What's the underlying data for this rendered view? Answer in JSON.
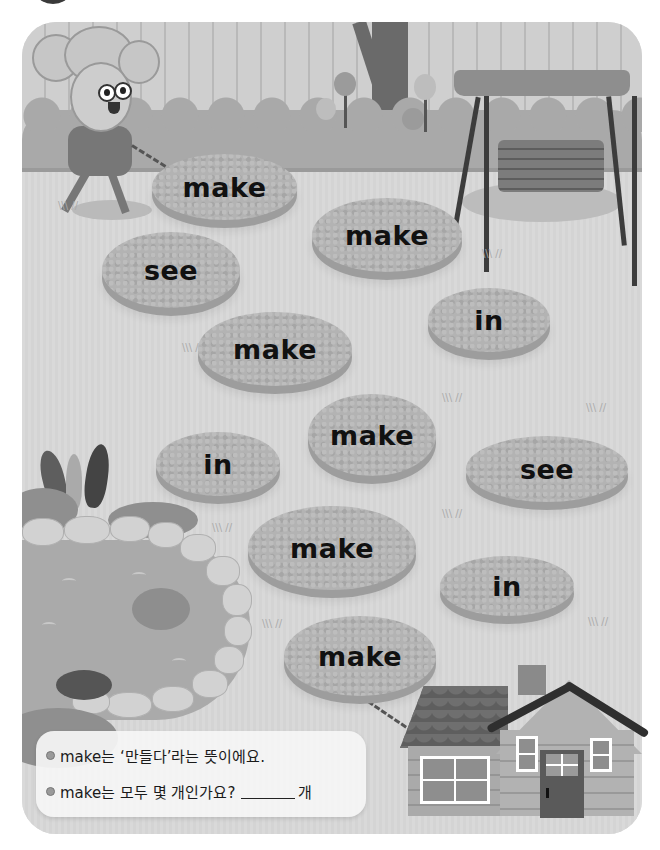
{
  "colors": {
    "stone": "#b3b3b3",
    "lawn": "#d8d8d8",
    "text": "#111111",
    "info_box_bg": "#f5f5f5"
  },
  "stones": [
    {
      "word": "make",
      "x": 152,
      "y": 154,
      "w": 145,
      "h": 66
    },
    {
      "word": "make",
      "x": 312,
      "y": 198,
      "w": 150,
      "h": 74
    },
    {
      "word": "see",
      "x": 102,
      "y": 232,
      "w": 138,
      "h": 76
    },
    {
      "word": "in",
      "x": 428,
      "y": 288,
      "w": 122,
      "h": 64
    },
    {
      "word": "make",
      "x": 198,
      "y": 312,
      "w": 154,
      "h": 74
    },
    {
      "word": "make",
      "x": 308,
      "y": 394,
      "w": 128,
      "h": 82
    },
    {
      "word": "in",
      "x": 156,
      "y": 432,
      "w": 124,
      "h": 64
    },
    {
      "word": "see",
      "x": 466,
      "y": 436,
      "w": 162,
      "h": 66
    },
    {
      "word": "make",
      "x": 248,
      "y": 506,
      "w": 168,
      "h": 84
    },
    {
      "word": "in",
      "x": 440,
      "y": 556,
      "w": 134,
      "h": 60
    },
    {
      "word": "make",
      "x": 284,
      "y": 616,
      "w": 152,
      "h": 80
    }
  ],
  "info_box": {
    "line1": "make는 ‘만들다’라는 뜻이에요.",
    "line2_prefix": "make는 모두 몇 개인가요?",
    "line2_suffix": "개"
  },
  "icons": {
    "bullet": "bullet-dot-icon"
  }
}
